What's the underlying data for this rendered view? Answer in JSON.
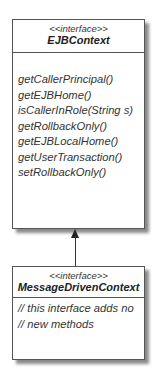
{
  "parent": {
    "stereotype": "<<interface>>",
    "name": "EJBContext",
    "methods": [
      "getCallerPrincipal()",
      "getEJBHome()",
      "isCallerInRole(String s)",
      "getRollbackOnly()",
      "getEJBLocalHome()",
      "getUserTransaction()",
      "setRollbackOnly()"
    ]
  },
  "child": {
    "stereotype": "<<interface>>",
    "name": "MessageDrivenContext",
    "comments": [
      "// this interface adds no",
      "// new methods"
    ]
  },
  "relationship": "generalization"
}
